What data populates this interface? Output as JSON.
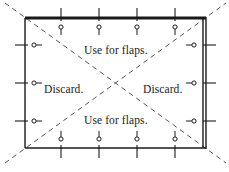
{
  "figure": {
    "name": "cutting-layout-diagram",
    "width": 229,
    "height": 172,
    "background_color": "#ffffff",
    "line_color": "#1a1a1a",
    "dash_color": "#555555"
  },
  "sheet": {
    "name": "rectangular-sheet",
    "left": 25,
    "top": 18,
    "right": 206,
    "bottom": 148,
    "top_border_weight": 3,
    "right_border_style": "double"
  },
  "labels": {
    "top": "Use for flaps.",
    "left": "Discard.",
    "right": "Discard.",
    "bottom": "Use for flaps."
  },
  "diagonals": [
    {
      "name": "diagonal-tl-br",
      "x1": 5,
      "y1": 3,
      "x2": 226,
      "y2": 163
    },
    {
      "name": "diagonal-bl-tr",
      "x1": 5,
      "y1": 163,
      "x2": 226,
      "y2": 3
    }
  ],
  "ticks": {
    "top": [
      61,
      99,
      137,
      175
    ],
    "bottom": [
      61,
      99,
      137,
      175
    ],
    "left": [
      45,
      83,
      121
    ],
    "right": [
      45,
      83,
      121
    ]
  },
  "pins": {
    "top": [
      61,
      99,
      137,
      175
    ],
    "bottom": [
      61,
      99,
      137,
      175
    ],
    "left": [
      45,
      83,
      121
    ],
    "right": [
      45,
      83,
      121
    ]
  }
}
